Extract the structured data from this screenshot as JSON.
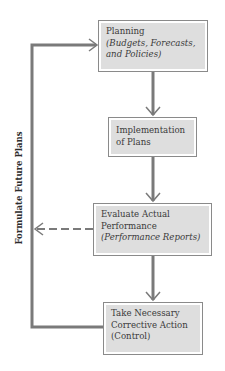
{
  "diagram": {
    "type": "feedback-loop flowchart",
    "boxes": [
      {
        "id": "planning",
        "line1": "Planning",
        "line2": "(Budgets, Forecasts,",
        "line3": "and Policies)"
      },
      {
        "id": "implementation",
        "line1": "Implementation",
        "line2": "of Plans"
      },
      {
        "id": "evaluate",
        "line1": "Evaluate Actual",
        "line2": "Performance",
        "line3": "(Performance Reports)"
      },
      {
        "id": "corrective",
        "line1": "Take Necessary",
        "line2": "Corrective Action",
        "line3": "(Control)"
      }
    ],
    "side_label": "Formulate Future Plans",
    "edges": [
      {
        "from": "planning",
        "to": "implementation",
        "style": "solid"
      },
      {
        "from": "implementation",
        "to": "evaluate",
        "style": "solid"
      },
      {
        "from": "evaluate",
        "to": "corrective",
        "style": "solid"
      },
      {
        "from": "evaluate",
        "to": "feedback-line",
        "style": "dashed"
      },
      {
        "from": "corrective",
        "to": "planning",
        "style": "solid",
        "via": "left feedback loop"
      }
    ],
    "colors": {
      "line": "#7a7a7a",
      "box_fill": "#dedede",
      "box_border": "#8a8a8a",
      "text": "#3a3a3a"
    }
  }
}
